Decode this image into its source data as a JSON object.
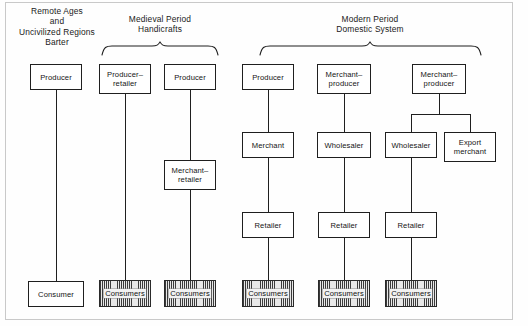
{
  "figure": {
    "title_visible": false,
    "ink_color": "#1f1f1f",
    "background": "#ffffff"
  },
  "sections": [
    {
      "id": "remote-ages",
      "heading": "Remote Ages\nand\nUncivilized Regions\nBarter",
      "has_brace": false
    },
    {
      "id": "medieval",
      "heading": "Medieval Period\nHandicrafts",
      "has_brace": true
    },
    {
      "id": "modern",
      "heading": "Modern Period\nDomestic System",
      "has_brace": true
    }
  ],
  "chains": [
    {
      "id": "chain-1",
      "section": "remote-ages",
      "nodes": [
        {
          "id": "n1-producer",
          "label": "Producer",
          "style": "plain"
        },
        {
          "id": "n1-consumer",
          "label": "Consumer",
          "style": "plain"
        }
      ]
    },
    {
      "id": "chain-2",
      "section": "medieval",
      "nodes": [
        {
          "id": "n2-producer-retailer",
          "label": "Producer–\nretailer",
          "style": "plain"
        },
        {
          "id": "n2-consumers",
          "label": "Consumers",
          "style": "hatched"
        }
      ]
    },
    {
      "id": "chain-3",
      "section": "medieval",
      "nodes": [
        {
          "id": "n3-producer",
          "label": "Producer",
          "style": "plain"
        },
        {
          "id": "n3-merchant-retailer",
          "label": "Merchant–\nretailer",
          "style": "plain"
        },
        {
          "id": "n3-consumers",
          "label": "Consumers",
          "style": "hatched"
        }
      ]
    },
    {
      "id": "chain-4",
      "section": "modern",
      "nodes": [
        {
          "id": "n4-producer",
          "label": "Producer",
          "style": "plain"
        },
        {
          "id": "n4-merchant",
          "label": "Merchant",
          "style": "plain"
        },
        {
          "id": "n4-retailer",
          "label": "Retailer",
          "style": "plain"
        },
        {
          "id": "n4-consumers",
          "label": "Consumers",
          "style": "hatched"
        }
      ]
    },
    {
      "id": "chain-5",
      "section": "modern",
      "nodes": [
        {
          "id": "n5-merchant-producer",
          "label": "Merchant–\nproducer",
          "style": "plain"
        },
        {
          "id": "n5-wholesaler",
          "label": "Wholesaler",
          "style": "plain"
        },
        {
          "id": "n5-retailer",
          "label": "Retailer",
          "style": "plain"
        },
        {
          "id": "n5-consumers",
          "label": "Consumers",
          "style": "hatched"
        }
      ]
    },
    {
      "id": "chain-6",
      "section": "modern",
      "nodes": [
        {
          "id": "n6-merchant-producer",
          "label": "Merchant–\nproducer",
          "style": "plain"
        },
        {
          "id": "n6-wholesaler",
          "label": "Wholesaler",
          "style": "plain"
        },
        {
          "id": "n6-export-merchant",
          "label": "Export\nmerchant",
          "style": "plain"
        },
        {
          "id": "n6-retailer",
          "label": "Retailer",
          "style": "plain"
        },
        {
          "id": "n6-consumers",
          "label": "Consumers",
          "style": "hatched"
        }
      ]
    }
  ],
  "labels": {
    "heading_remote": "Remote Ages\nand\nUncivilized Regions\nBarter",
    "heading_medieval": "Medieval Period\nHandicrafts",
    "heading_modern": "Modern Period\nDomestic System",
    "producer_1": "Producer",
    "consumer_1": "Consumer",
    "producer_retailer_2": "Producer–\nretailer",
    "consumers_2": "Consumers",
    "producer_3": "Producer",
    "merchant_retailer_3": "Merchant–\nretailer",
    "consumers_3": "Consumers",
    "producer_4": "Producer",
    "merchant_4": "Merchant",
    "retailer_4": "Retailer",
    "consumers_4": "Consumers",
    "merchant_producer_5": "Merchant–\nproducer",
    "wholesaler_5": "Wholesaler",
    "retailer_5": "Retailer",
    "consumers_5": "Consumers",
    "merchant_producer_6": "Merchant–\nproducer",
    "wholesaler_6": "Wholesaler",
    "export_merchant_6": "Export\nmerchant",
    "retailer_6": "Retailer",
    "consumers_6": "Consumers"
  }
}
